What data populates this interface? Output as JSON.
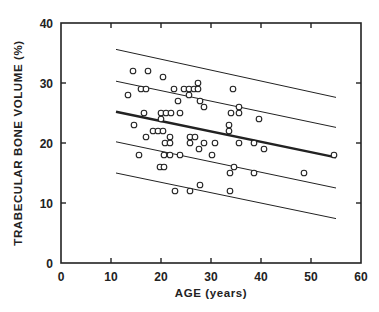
{
  "chart_data": {
    "type": "scatter",
    "title": "",
    "xlabel": "AGE (years)",
    "ylabel": "TRABECULAR BONE VOLUME (%)",
    "xlim": [
      0,
      60
    ],
    "ylim": [
      0,
      40
    ],
    "x_ticks": [
      0,
      10,
      20,
      30,
      40,
      50,
      60
    ],
    "y_ticks": [
      0,
      10,
      20,
      30,
      40
    ],
    "grid": false,
    "legend": null,
    "series": [
      {
        "name": "observations",
        "marker": "open-circle",
        "points": [
          [
            14.4,
            32
          ],
          [
            17.4,
            32
          ],
          [
            20.4,
            31
          ],
          [
            13.4,
            28
          ],
          [
            16,
            29
          ],
          [
            17,
            29
          ],
          [
            22.6,
            29
          ],
          [
            24.6,
            29
          ],
          [
            25.6,
            29
          ],
          [
            26.6,
            29
          ],
          [
            27.4,
            29
          ],
          [
            27.4,
            30
          ],
          [
            25.6,
            28
          ],
          [
            23.4,
            27
          ],
          [
            27.8,
            27
          ],
          [
            28.6,
            26
          ],
          [
            16.6,
            25
          ],
          [
            20,
            25
          ],
          [
            21,
            25
          ],
          [
            22,
            25
          ],
          [
            20,
            24
          ],
          [
            23.8,
            25
          ],
          [
            14.6,
            23
          ],
          [
            17,
            21
          ],
          [
            18.4,
            22
          ],
          [
            19.4,
            22
          ],
          [
            20.4,
            22
          ],
          [
            21.8,
            21
          ],
          [
            20.8,
            20
          ],
          [
            21.8,
            20
          ],
          [
            25.8,
            21
          ],
          [
            26.8,
            21
          ],
          [
            25.8,
            20
          ],
          [
            28.6,
            20
          ],
          [
            27.6,
            19
          ],
          [
            30.8,
            20
          ],
          [
            30.2,
            18
          ],
          [
            15.6,
            18
          ],
          [
            20.6,
            18
          ],
          [
            21.8,
            18
          ],
          [
            23.8,
            18
          ],
          [
            19.8,
            16
          ],
          [
            20.6,
            16
          ],
          [
            22.8,
            12
          ],
          [
            25.8,
            12
          ],
          [
            27.8,
            13
          ],
          [
            33.8,
            12
          ],
          [
            33.8,
            15
          ],
          [
            34.6,
            16
          ],
          [
            35.6,
            20
          ],
          [
            38.6,
            20
          ],
          [
            40.6,
            19
          ],
          [
            33.6,
            22
          ],
          [
            33.6,
            23
          ],
          [
            34.4,
            29
          ],
          [
            35.6,
            25
          ],
          [
            35.6,
            26
          ],
          [
            39.6,
            24
          ],
          [
            34,
            25
          ],
          [
            38.6,
            15
          ],
          [
            48.6,
            15
          ],
          [
            54.6,
            18
          ]
        ]
      }
    ],
    "lines": [
      {
        "name": "regression",
        "x": [
          11,
          55
        ],
        "y": [
          25.2,
          17.6
        ],
        "width": 2.4
      },
      {
        "name": "+5",
        "x": [
          11,
          55
        ],
        "y": [
          35.6,
          27.6
        ],
        "width": 1
      },
      {
        "name": "+2.5sd",
        "x": [
          11,
          55
        ],
        "y": [
          30.3,
          22.6
        ],
        "width": 1
      },
      {
        "name": "-2.5sd",
        "x": [
          11,
          55
        ],
        "y": [
          20.2,
          12.5
        ],
        "width": 1
      },
      {
        "name": "-5",
        "x": [
          11,
          55
        ],
        "y": [
          15.0,
          7.4
        ],
        "width": 1
      }
    ]
  },
  "layout": {
    "plot_left": 61,
    "plot_right": 361,
    "plot_top": 23,
    "plot_bottom": 263,
    "ink_color": "#222222"
  }
}
